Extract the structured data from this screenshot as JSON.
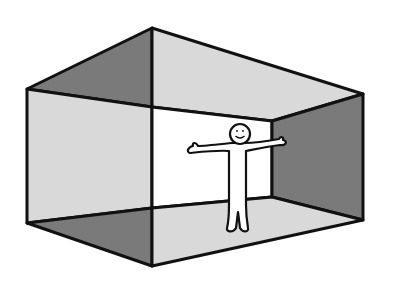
{
  "illustration": {
    "subject": "stick figure standing inside an open box room",
    "colors": {
      "background": "#ffffff",
      "light_face": "#d9d9d9",
      "dark_face": "#7a7a7a",
      "back_wall": "#ffffff",
      "outline": "#111111",
      "figure_fill": "#ffffff"
    }
  }
}
